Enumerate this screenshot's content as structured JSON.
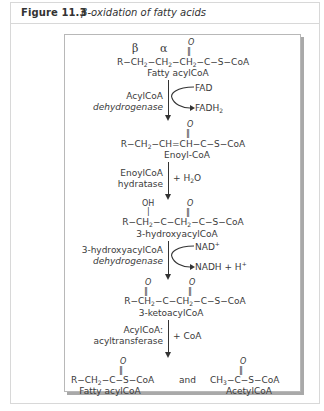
{
  "header": {
    "figure_number": "Figure 11.3",
    "caption": "β-oxidation of fatty acids"
  },
  "diagram": {
    "greek_beta": "β",
    "greek_alpha": "α",
    "carbonyl_o": "O",
    "double_bond": "‖",
    "oh": "OH",
    "single_bond": "|",
    "step0": {
      "formula": "R−CH₂−CH₂−CH₂−C−S−CoA",
      "name": "Fatty acylCoA"
    },
    "enzyme1": {
      "line1": "AcylCoA",
      "line2": "dehydrogenase",
      "in": "FAD",
      "out": "FADH₂"
    },
    "step1": {
      "formula": "R−CH₂−CH=CH−C−S−CoA",
      "name": "Enoyl-CoA"
    },
    "enzyme2": {
      "line1": "EnoylCoA",
      "line2": "hydratase",
      "add": "+ H₂O"
    },
    "step2": {
      "formula": "R−CH₂−C−CH₂−C−S−CoA",
      "name": "3-hydroxyacylCoA"
    },
    "enzyme3": {
      "line1": "3-hydroxyacylCoA",
      "line2": "dehydrogenase",
      "in": "NAD⁺",
      "out": "NADH + H⁺"
    },
    "step3": {
      "formula": "R−CH₂−C−CH₂−C−S−CoA",
      "name": "3-ketoacylCoA"
    },
    "enzyme4": {
      "line1": "AcylCoA:",
      "line2": "acyltransferase",
      "add": "+ CoA"
    },
    "product1": {
      "formula": "R−CH₂−C−S−CoA",
      "name": "Fatty acylCoA"
    },
    "and": "and",
    "product2": {
      "formula": "CH₃−C−S−CoA",
      "name": "AcetylCoA"
    }
  }
}
